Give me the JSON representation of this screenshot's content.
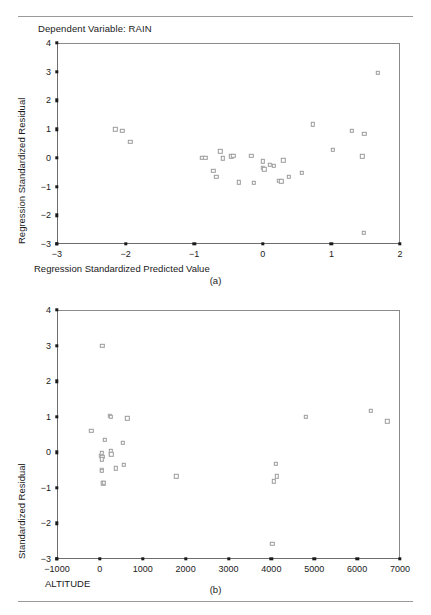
{
  "figure": {
    "title": "Dependent Variable: RAIN",
    "panel_a_label": "(a)",
    "panel_b_label": "(b)",
    "marker_color": "#9b9b9b",
    "axis_color": "#6d6d6d"
  },
  "chart_data": [
    {
      "type": "scatter",
      "id": "panel-a",
      "title": "Dependent Variable: RAIN",
      "xlabel": "Regression Standardized Predicted Value",
      "ylabel": "Regression Standardized Residual",
      "xlim": [
        -3,
        2
      ],
      "ylim": [
        -3,
        4
      ],
      "xticks": [
        -3,
        -2,
        -1,
        0,
        1,
        2
      ],
      "xtick_labels": [
        "-3",
        "-2",
        "-1",
        "0",
        "1",
        "2"
      ],
      "yticks": [
        -3,
        -2,
        -1,
        0,
        1,
        2,
        3,
        4
      ],
      "ytick_labels": [
        "-3",
        "-2",
        "-1",
        "0",
        "1",
        "2",
        "3",
        "4"
      ],
      "grid": false,
      "legend": false,
      "points": [
        [
          -2.15,
          1.0
        ],
        [
          -2.05,
          0.95
        ],
        [
          -1.93,
          0.55
        ],
        [
          -0.88,
          0.0
        ],
        [
          -0.84,
          0.0
        ],
        [
          -0.72,
          -0.45
        ],
        [
          -0.68,
          -0.67
        ],
        [
          -0.62,
          0.23
        ],
        [
          -0.58,
          -0.02
        ],
        [
          -0.46,
          0.05
        ],
        [
          -0.43,
          0.07
        ],
        [
          -0.35,
          -0.85
        ],
        [
          -0.17,
          0.08
        ],
        [
          -0.13,
          -0.87
        ],
        [
          0.0,
          -0.12
        ],
        [
          0.0,
          -0.35
        ],
        [
          0.02,
          -0.4
        ],
        [
          0.1,
          -0.25
        ],
        [
          0.16,
          -0.28
        ],
        [
          0.24,
          -0.8
        ],
        [
          0.27,
          -0.82
        ],
        [
          0.3,
          -0.08
        ],
        [
          0.38,
          -0.65
        ],
        [
          0.57,
          -0.52
        ],
        [
          0.73,
          1.17
        ],
        [
          1.02,
          0.28
        ],
        [
          1.3,
          0.95
        ],
        [
          1.45,
          0.05
        ],
        [
          1.48,
          0.83
        ],
        [
          1.47,
          -2.6
        ],
        [
          1.68,
          2.97
        ]
      ]
    },
    {
      "type": "scatter",
      "id": "panel-b",
      "title": "",
      "xlabel": "ALTITUDE",
      "ylabel": "Standardized Residual",
      "xlim": [
        -1000,
        7000
      ],
      "ylim": [
        -3,
        4
      ],
      "xticks": [
        -1000,
        0,
        1000,
        2000,
        3000,
        4000,
        5000,
        6000,
        7000
      ],
      "xtick_labels": [
        "-1000",
        "0",
        "1000",
        "2000",
        "3000",
        "4000",
        "5000",
        "6000",
        "7000"
      ],
      "yticks": [
        -3,
        -2,
        -1,
        0,
        1,
        2,
        3,
        4
      ],
      "ytick_labels": [
        "-3",
        "-2",
        "-1",
        "0",
        "1",
        "2",
        "3",
        "4"
      ],
      "grid": false,
      "legend": false,
      "points": [
        [
          60,
          3.0
        ],
        [
          -200,
          0.6
        ],
        [
          230,
          1.03
        ],
        [
          250,
          1.0
        ],
        [
          640,
          0.96
        ],
        [
          120,
          0.35
        ],
        [
          40,
          -0.03
        ],
        [
          30,
          -0.1
        ],
        [
          60,
          -0.12
        ],
        [
          250,
          0.03
        ],
        [
          260,
          -0.05
        ],
        [
          270,
          -0.06
        ],
        [
          530,
          0.27
        ],
        [
          50,
          -0.2
        ],
        [
          40,
          -0.5
        ],
        [
          50,
          -0.52
        ],
        [
          370,
          -0.45
        ],
        [
          560,
          -0.35
        ],
        [
          70,
          -0.85
        ],
        [
          80,
          -0.87
        ],
        [
          90,
          -0.86
        ],
        [
          1780,
          -0.68
        ],
        [
          4100,
          -0.32
        ],
        [
          4120,
          -0.67
        ],
        [
          4060,
          -0.82
        ],
        [
          4020,
          -2.58
        ],
        [
          4800,
          1.0
        ],
        [
          6320,
          1.17
        ],
        [
          6700,
          0.87
        ]
      ]
    }
  ]
}
